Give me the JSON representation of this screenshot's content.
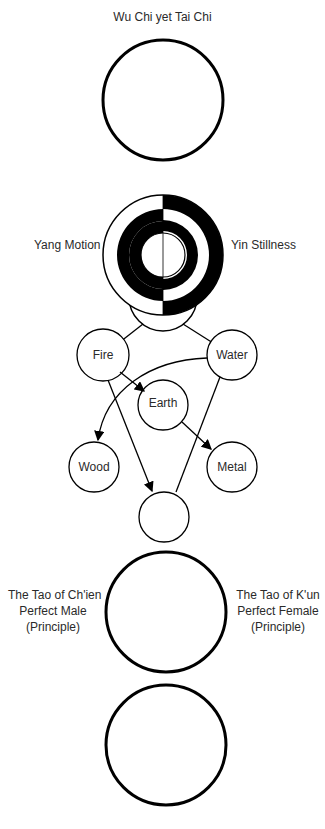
{
  "title": "Wu Chi yet Tai Chi",
  "yang_label": "Yang Motion",
  "yin_label": "Yin Stillness",
  "elements": {
    "fire": "Fire",
    "water": "Water",
    "earth": "Earth",
    "wood": "Wood",
    "metal": "Metal"
  },
  "chien": {
    "line1": "The Tao of Ch'ien",
    "line2": "Perfect Male",
    "line3": "(Principle)"
  },
  "kun": {
    "line1": "The Tao of K'un",
    "line2": "Perfect Female",
    "line3": "(Principle)"
  },
  "colors": {
    "stroke": "#000000",
    "text": "#2a2a2a",
    "background": "#ffffff"
  }
}
